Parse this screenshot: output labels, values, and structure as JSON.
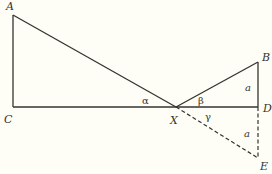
{
  "diagram": {
    "colors": {
      "background": "#fefef6",
      "line": "#333333",
      "text": "#333333"
    },
    "points": {
      "A": {
        "label": "A",
        "x": 13,
        "y": 15
      },
      "C": {
        "label": "C",
        "x": 13,
        "y": 107
      },
      "X": {
        "label": "X",
        "x": 176,
        "y": 107
      },
      "B": {
        "label": "B",
        "x": 258,
        "y": 62
      },
      "D": {
        "label": "D",
        "x": 258,
        "y": 107
      },
      "E": {
        "label": "E",
        "x": 258,
        "y": 158
      }
    },
    "angles": {
      "alpha": "α",
      "beta": "β",
      "gamma": "γ"
    },
    "sides": {
      "BD": "a",
      "DE": "a"
    },
    "segments": {
      "solid": [
        "AC",
        "CD",
        "AX",
        "XB",
        "BD"
      ],
      "dashed": [
        "XE",
        "DE"
      ]
    }
  }
}
